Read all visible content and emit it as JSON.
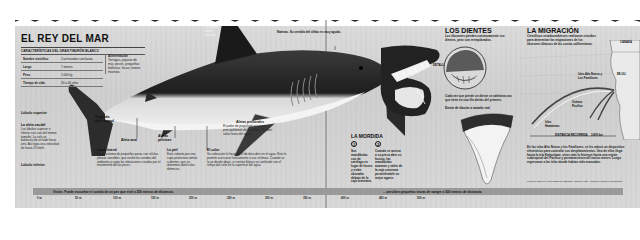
{
  "title": "EL REY DEL MAR",
  "facts": {
    "caption": "CARACTERÍSTICAS DEL GRAN TIBURÓN BLANCO",
    "rows": [
      {
        "label": "Nombre científico",
        "value": "Carcharodon carcharias"
      },
      {
        "label": "Largo",
        "value": "7 metros"
      },
      {
        "label": "Peso",
        "value": "2.000 kg"
      },
      {
        "label": "Tiempo de vida",
        "value": "30 a 40 años"
      }
    ],
    "food_label": "Alimentación",
    "food_value": "Tortugas, pájaros de mar, peces, pequeñas ballenas, focas, leones marinos."
  },
  "anatomy": {
    "first_dorsal": "Primera aleta dorsal",
    "second_dorsal": "Segunda aleta dorsal",
    "upper_lobe": "Lóbulo superior",
    "tail_fin_title": "La aleta caudal",
    "tail_fin_text": "Los lóbulos superior e inferior son casi del mismo tamaño. La cola se balancea de un lado hacia otro. Así logra una velocidad de hasta 25 km/h.",
    "lower_lobe": "Lóbulo inferior",
    "anal_fin": "Aleta anal",
    "pelvic_fins": "Aletas pélvicas",
    "lateral_line_title": "Línea lateral",
    "lateral_line_text": "Es un sistema de pequeños poros con células pilosas sensibles, que recibe los sonidos del ambiente y capta las vibraciones creadas por el movimiento de los peces.",
    "skin_title": "La piel",
    "skin_text": "Está cubierta por una capa protectora similar a dientes, que se denomina dentículos dérmicos.",
    "pectoral_title": "Aletas pectorales",
    "pectoral_text": "El poder de propulsión proviene principalmente de las aletas. Pueden saltar fuera del agua.",
    "color_title": "El color",
    "color_text": "Su coloración lo hace difícil de descubrir en el agua. Esto le permite acercarse furtivamente a sus víctimas. Cuando se lo ve desde abajo, su vientre blanco se confunde con el reflejo del cielo en la superficie del agua.",
    "nostrils": "Narinas. Su sentido del olfato es muy agudo."
  },
  "teeth": {
    "title": "LOS DIENTES",
    "intro": "Los tiburones pierden continuamente sus dientes, pero son reemplazados.",
    "detail_label": "DETALLE",
    "replace_text": "Cada vez que pierde un diente se adelanta uno que tiene en una fila detrás del primero.",
    "actual_size": "Diente de tiburón a tamaño real"
  },
  "bite": {
    "title": "LA MORDIDA",
    "step1_num": "1",
    "step1_text": "Sus mandíbulas son de cartílago en lugar de hueso y están ubicadas debajo de la caja craneana.",
    "step2_num": "2",
    "step2_text": "Cuando se acerca a su presa abre su hocico, las mandíbulas avanzan y salen de la caja craneana permitiéndole un mejor agarre."
  },
  "migration": {
    "title": "LA MIGRACIÓN",
    "intro": "Científicos estadounidenses realizaron estudios para determinar las migraciones de los tiburones blancos de las costas californianas.",
    "canada": "CANADÁ",
    "usa": "EE.UU.",
    "islands": "Islas Año Nuevo y Los Farallones",
    "ocean": "Océano Pacífico",
    "hawaii": "Islas Hawaianas",
    "distance_label": "DISTANCIA RECORRIDA",
    "distance_value": "3.800 km",
    "body": "En las islas Año Nuevo y los Farallones, se les adosó un dispositivo electrónico para controlar sus desplazamientos. Uno de ellos llegó hasta la isla Kahoolawe, otros más lo hicieron hacia una región subtropical del Pacífico y permanecieron allí varios meses. Luego regresaron a las islas donde habían sido marcados.",
    "credits": "Fuentes: Science, Universidad de Stanford, Monterey Bay Aquarium, National Geographic."
  },
  "depth_bar": {
    "sight_text": "Visión. Puede escuchar el sonido de un pez que esté a 250 metros de distancia.",
    "smell_text": "... perciben pequeñas trazas de sangre a 500 metros de distancia.",
    "ticks": [
      "0 m",
      "50 m",
      "100 m",
      "150 m",
      "200 m",
      "250 m",
      "300 m",
      "350 m",
      "400 m",
      "450 m",
      "500 m"
    ]
  },
  "colors": {
    "paper": "#d4d4d4",
    "ink": "#111111",
    "bar": "#9a9a9a",
    "shark_dark": "#2a2a2a",
    "shark_light": "#e8e8e8"
  }
}
